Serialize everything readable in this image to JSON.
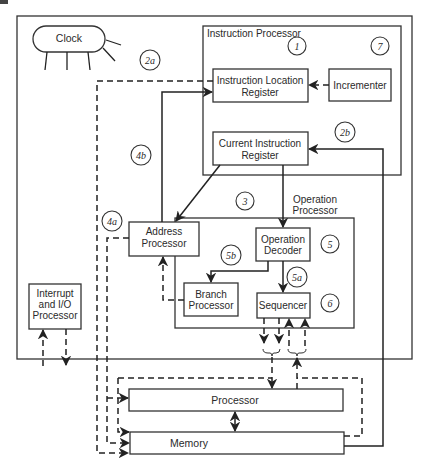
{
  "diagram": {
    "outer_frame": "computer-system",
    "clock": {
      "label": "Clock"
    },
    "instruction_processor": {
      "title": "Instruction Processor",
      "instruction_location_register": {
        "line1": "Instruction Location",
        "line2": "Register"
      },
      "incrementer": {
        "label": "Incrementer"
      },
      "current_instruction_register": {
        "line1": "Current Instruction",
        "line2": "Register"
      }
    },
    "address_processor": {
      "line1": "Address",
      "line2": "Processor"
    },
    "operation_processor": {
      "title_line1": "Operation",
      "title_line2": "Processor",
      "operation_decoder": {
        "line1": "Operation",
        "line2": "Decoder"
      },
      "branch_processor": {
        "line1": "Branch",
        "line2": "Processor"
      },
      "sequencer": {
        "label": "Sequencer"
      }
    },
    "interrupt_io_processor": {
      "line1": "Interrupt",
      "line2": "and I/O",
      "line3": "Processor"
    },
    "processor_bar": {
      "label": "Processor"
    },
    "memory_bar": {
      "label": "Memory"
    },
    "step_markers": {
      "m1": "1",
      "m7": "7",
      "m2a": "2a",
      "m2b": "2b",
      "m3": "3",
      "m4a": "4a",
      "m4b": "4b",
      "m5": "5",
      "m5a": "5a",
      "m5b": "5b",
      "m6": "6"
    }
  }
}
